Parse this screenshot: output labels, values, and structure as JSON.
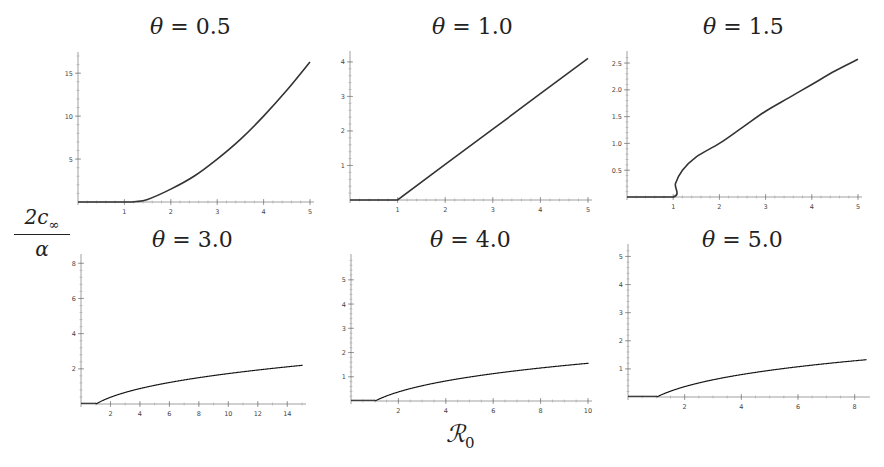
{
  "figure": {
    "y_axis_label": {
      "numerator": "2c",
      "numerator_sub": "∞",
      "denominator": "α"
    },
    "x_axis_label": {
      "symbol": "ℛ",
      "sub": "0"
    }
  },
  "panels": [
    {
      "title_var": "θ",
      "title_eq": " = 0.5"
    },
    {
      "title_var": "θ",
      "title_eq": " = 1.0"
    },
    {
      "title_var": "θ",
      "title_eq": " = 1.5"
    },
    {
      "title_var": "θ",
      "title_eq": " = 3.0"
    },
    {
      "title_var": "θ",
      "title_eq": " = 4.0"
    },
    {
      "title_var": "θ",
      "title_eq": " = 5.0"
    }
  ],
  "chart_data": [
    {
      "type": "line",
      "title": "θ = 0.5",
      "xlabel": "ℛ0",
      "ylabel": "2c∞/α",
      "xlim": [
        0,
        5
      ],
      "ylim": [
        0,
        17
      ],
      "xticks": [
        1,
        2,
        3,
        4,
        5
      ],
      "yticks": [
        5,
        10,
        15
      ],
      "x": [
        0,
        1,
        1.25,
        1.5,
        2,
        2.5,
        3,
        3.5,
        4,
        4.5,
        5
      ],
      "y": [
        0,
        0,
        0.05,
        0.3,
        1.5,
        3.0,
        5.0,
        7.3,
        10.0,
        13.0,
        16.3
      ]
    },
    {
      "type": "line",
      "title": "θ = 1.0",
      "xlabel": "ℛ0",
      "ylabel": "2c∞/α",
      "xlim": [
        0,
        5
      ],
      "ylim": [
        0,
        4.2
      ],
      "xticks": [
        1,
        2,
        3,
        4,
        5
      ],
      "yticks": [
        1,
        2,
        3,
        4
      ],
      "x": [
        0,
        1,
        2,
        3,
        4,
        5
      ],
      "y": [
        0,
        0,
        1.03,
        2.05,
        3.08,
        4.1
      ]
    },
    {
      "type": "line",
      "title": "θ = 1.5",
      "xlabel": "ℛ0",
      "ylabel": "2c∞/α",
      "xlim": [
        0,
        5
      ],
      "ylim": [
        0,
        2.65
      ],
      "xticks": [
        1,
        2,
        3,
        4,
        5
      ],
      "yticks": [
        0.5,
        1.0,
        1.5,
        2.0,
        2.5
      ],
      "x": [
        0,
        1,
        1.05,
        1.2,
        1.5,
        2,
        2.5,
        3,
        3.5,
        4,
        4.5,
        5
      ],
      "y": [
        0,
        0,
        0.25,
        0.5,
        0.75,
        1.0,
        1.3,
        1.6,
        1.85,
        2.1,
        2.35,
        2.57
      ]
    },
    {
      "type": "scatter",
      "subtype": "bifurcation",
      "title": "θ = 3.0",
      "xlabel": "ℛ0",
      "ylabel": "2c∞/α",
      "xlim": [
        0,
        15
      ],
      "ylim": [
        0,
        8.3
      ],
      "xticks": [
        2,
        4,
        6,
        8,
        10,
        12,
        14
      ],
      "yticks": [
        2,
        4,
        6,
        8
      ],
      "theta": 3.0,
      "features": {
        "transcritical_at": 1.0,
        "first_period_doubling_at": 3.0,
        "second_period_doubling_at": 7.2,
        "third_period_doubling_at": 12.0,
        "max_y": 8.0
      }
    },
    {
      "type": "scatter",
      "subtype": "bifurcation",
      "title": "θ = 4.0",
      "xlabel": "ℛ0",
      "ylabel": "2c∞/α",
      "xlim": [
        0,
        10
      ],
      "ylim": [
        0,
        5.9
      ],
      "xticks": [
        2,
        4,
        6,
        8,
        10
      ],
      "yticks": [
        1,
        2,
        3,
        4,
        5
      ],
      "theta": 4.0,
      "features": {
        "transcritical_at": 1.0,
        "first_period_doubling_at": 2.0,
        "chaos_onset": 3.3,
        "periodic_window_at": 4.4,
        "chaos_end": 6.7,
        "max_y": 5.8
      }
    },
    {
      "type": "scatter",
      "subtype": "bifurcation",
      "title": "θ = 5.0",
      "xlabel": "ℛ0",
      "ylabel": "2c∞/α",
      "xlim": [
        0,
        8.4
      ],
      "ylim": [
        0,
        5.3
      ],
      "xticks": [
        2,
        4,
        6,
        8
      ],
      "yticks": [
        1,
        2,
        3,
        4,
        5
      ],
      "theta": 5.0,
      "features": {
        "transcritical_at": 1.0,
        "first_period_doubling_at": 1.6,
        "chaos_onset": 2.2,
        "periodic_window": [
          3.0,
          3.5
        ],
        "narrow_window_at": 4.8,
        "max_y": 5.15
      }
    }
  ]
}
